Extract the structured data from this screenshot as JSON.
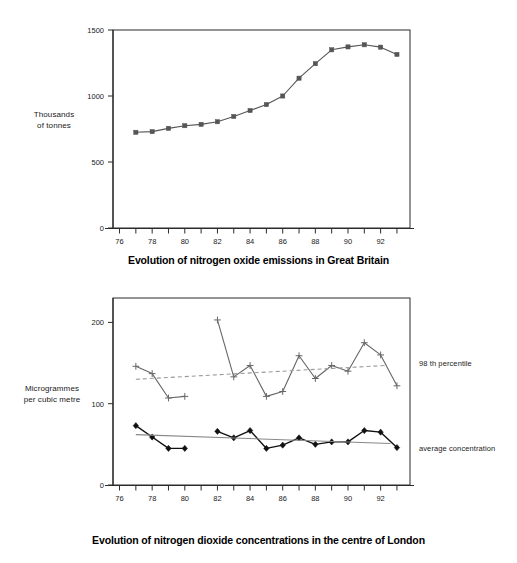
{
  "chart_data": [
    {
      "id": "nox-emissions",
      "type": "line",
      "title": "Evolution of nitrogen oxide emissions in Great Britain",
      "xlabel": "",
      "ylabel": "Thousands of tonnes",
      "ylabel_lines": [
        "Thousands",
        "of tonnes"
      ],
      "xlim": [
        75.6,
        93.8
      ],
      "ylim": [
        0,
        1500
      ],
      "yticks": [
        0,
        500,
        1000,
        1500
      ],
      "ytick_labels": [
        "0",
        "500",
        "1000",
        "1500"
      ],
      "xticks": [
        76,
        77,
        78,
        79,
        80,
        81,
        82,
        83,
        84,
        85,
        86,
        87,
        88,
        89,
        90,
        91,
        92,
        93
      ],
      "xtick_labels_shown": [
        "76",
        "78",
        "80",
        "82",
        "84",
        "86",
        "88",
        "90",
        "92"
      ],
      "grid": false,
      "legend": "none",
      "series": [
        {
          "name": "Nitrogen oxide emissions",
          "marker": "square",
          "color": "#555555",
          "x": [
            77,
            78,
            79,
            80,
            81,
            82,
            83,
            84,
            85,
            86,
            87,
            88,
            89,
            90,
            91,
            92,
            93
          ],
          "values": [
            725,
            730,
            755,
            775,
            785,
            805,
            845,
            890,
            935,
            1000,
            1135,
            1245,
            1350,
            1372,
            1388,
            1370,
            1315
          ]
        }
      ]
    },
    {
      "id": "no2-concentrations",
      "type": "line",
      "title": "Evolution of nitrogen dioxide concentrations in the centre of London",
      "xlabel": "",
      "ylabel": "Microgrammes per cubic metre",
      "ylabel_lines": [
        "Microgrammes",
        "per cubic metre"
      ],
      "xlim": [
        75.6,
        93.8
      ],
      "ylim": [
        0,
        230
      ],
      "yticks": [
        0,
        100,
        200
      ],
      "ytick_labels": [
        "0",
        "100",
        "200"
      ],
      "xticks": [
        76,
        77,
        78,
        79,
        80,
        81,
        82,
        83,
        84,
        85,
        86,
        87,
        88,
        89,
        90,
        91,
        92,
        93
      ],
      "xtick_labels_shown": [
        "76",
        "78",
        "80",
        "82",
        "84",
        "86",
        "88",
        "90",
        "92"
      ],
      "grid": false,
      "legend": "right-inline",
      "series": [
        {
          "name": "98 th percentile",
          "marker": "plus",
          "color": "#666666",
          "segments": [
            {
              "x": [
                77,
                78,
                79,
                80
              ],
              "values": [
                146,
                137,
                107,
                109
              ]
            },
            {
              "x": [
                82,
                83,
                84,
                85,
                86,
                87,
                88,
                89,
                90,
                91,
                92,
                93
              ],
              "values": [
                203,
                133,
                147,
                109,
                115,
                159,
                131,
                147,
                140,
                175,
                160,
                122
              ]
            }
          ]
        },
        {
          "name": "average concentration",
          "marker": "diamond",
          "color": "#111111",
          "segments": [
            {
              "x": [
                77,
                78,
                79,
                80
              ],
              "values": [
                73,
                59,
                45,
                45
              ]
            },
            {
              "x": [
                82,
                83,
                84,
                85,
                86,
                87,
                88,
                89,
                90,
                91,
                92,
                93
              ],
              "values": [
                66,
                58,
                67,
                45,
                49,
                58,
                50,
                53,
                53,
                67,
                65,
                46
              ]
            }
          ]
        },
        {
          "name": "98 th percentile trend",
          "style": "dashed",
          "color": "#999999",
          "trend_from": {
            "x": 77,
            "y": 130
          },
          "trend_to": {
            "x": 92.3,
            "y": 147
          }
        },
        {
          "name": "average concentration trend",
          "style": "solid",
          "color": "#888888",
          "trend_from": {
            "x": 77,
            "y": 62
          },
          "trend_to": {
            "x": 92.6,
            "y": 51
          }
        }
      ],
      "annotations": [
        {
          "id": "legend-percentile",
          "text": "98 th percentile"
        },
        {
          "id": "legend-average",
          "text": "average concentration"
        }
      ]
    }
  ]
}
